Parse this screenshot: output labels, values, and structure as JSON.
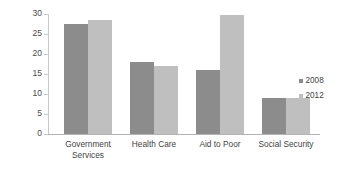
{
  "chart_data": {
    "type": "bar",
    "title": "",
    "xlabel": "",
    "ylabel": "Race Gap (%)",
    "ylim": [
      0,
      30
    ],
    "yticks": [
      0,
      5,
      10,
      15,
      20,
      25,
      30
    ],
    "ytick_labels": [
      "0",
      "5",
      "10",
      "15",
      "20",
      "25",
      "30"
    ],
    "grid": false,
    "legend_position": "right",
    "categories": [
      "Government\nServices",
      "Health Care",
      "Aid to Poor",
      "Social Security"
    ],
    "series": [
      {
        "name": "2008",
        "color": "#8c8c8c",
        "values": [
          27.5,
          18.0,
          16.0,
          9.0
        ]
      },
      {
        "name": "2012",
        "color": "#bfbfbf",
        "values": [
          28.5,
          17.0,
          29.8,
          9.0
        ]
      }
    ]
  }
}
